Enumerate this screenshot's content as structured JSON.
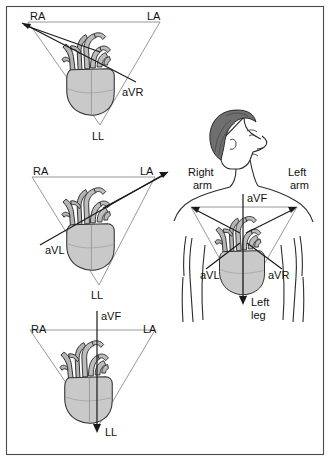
{
  "figure": {
    "frame": {
      "visible": true,
      "color": "#4a4a4a"
    },
    "colors": {
      "triangle_stroke": "#8d8d8d",
      "vector_stroke": "#1a1a1a",
      "heart_fill": "#c9c9c9",
      "vessel_fill": "#b4b4b4",
      "hair_fill": "#6f6f6f",
      "body_stroke": "#2b2b2b",
      "background": "#ffffff"
    }
  },
  "panels": [
    {
      "id": "panel-avr",
      "lead": "aVR",
      "vertices": {
        "right_arm": "RA",
        "left_arm": "LA",
        "left_leg": "LL"
      },
      "vector_label": "aVR",
      "vector_direction": "toward right arm (up and to the left)"
    },
    {
      "id": "panel-avl",
      "lead": "aVL",
      "vertices": {
        "right_arm": "RA",
        "left_arm": "LA",
        "left_leg": "LL"
      },
      "vector_label": "aVL",
      "vector_direction": "toward left arm (up and to the right)"
    },
    {
      "id": "panel-avf",
      "lead": "aVF",
      "vertices": {
        "right_arm": "RA",
        "left_arm": "LA",
        "left_leg": "LL"
      },
      "vector_label": "aVF",
      "vector_direction": "toward left leg (straight down)"
    }
  ],
  "body_panel": {
    "id": "panel-body",
    "labels": {
      "right_arm": "Right\narm",
      "right_arm_line1": "Right",
      "right_arm_line2": "arm",
      "left_arm_line1": "Left",
      "left_arm_line2": "arm",
      "left_leg_line1": "Left",
      "left_leg_line2": "leg",
      "avf": "aVF",
      "avl": "aVL",
      "avr": "aVR"
    },
    "description": "Torso with head in right profile showing all three augmented lead vectors originating at the heart"
  }
}
